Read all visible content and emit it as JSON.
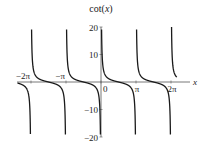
{
  "chart_data": {
    "type": "line",
    "title": "cot(x)",
    "xlabel": "x",
    "ylabel": "",
    "function": "cot(x)",
    "xlim": [
      -7.5,
      6.8
    ],
    "ylim": [
      -20,
      20
    ],
    "grid": false,
    "legend": null,
    "x_ticks": [
      {
        "value": -6.2832,
        "label": "−2π"
      },
      {
        "value": -3.1416,
        "label": "−π"
      },
      {
        "value": 0,
        "label": "0"
      },
      {
        "value": 3.1416,
        "label": "π"
      },
      {
        "value": 6.2832,
        "label": "2π"
      }
    ],
    "y_ticks": [
      {
        "value": 20,
        "label": "20"
      },
      {
        "value": 10,
        "label": "10"
      },
      {
        "value": -10,
        "label": "−10"
      },
      {
        "value": -20,
        "label": "−20"
      }
    ],
    "asymptotes": [
      -6.2832,
      -3.1416,
      0,
      3.1416,
      6.2832
    ],
    "series": [
      {
        "name": "cot(x)",
        "color": "#1a1a1a"
      }
    ]
  },
  "colors": {
    "curve": "#1a1a1a",
    "axis": "#555555",
    "text": "#222222"
  }
}
